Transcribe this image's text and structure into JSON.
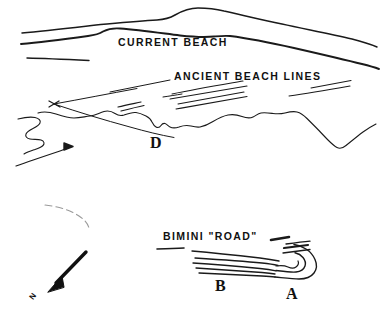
{
  "figure": {
    "name": "bimini-sketch-map",
    "background_color": "#ffffff",
    "ink_color": "#1a1a1a",
    "width": 385,
    "height": 320
  },
  "labels": {
    "current_beach": "CURRENT BEACH",
    "ancient_beach_lines": "ANCIENT BEACH LINES",
    "bimini_road": "BIMINI \"ROAD\"",
    "point_d": "D",
    "point_b": "B",
    "point_a": "A",
    "north": "N"
  },
  "features": [
    {
      "id": "current-beach-shoreline",
      "label": "CURRENT BEACH",
      "type": "shoreline"
    },
    {
      "id": "ancient-beach-lines",
      "label": "ANCIENT BEACH LINES",
      "type": "linear-ridges"
    },
    {
      "id": "submerged-coastline",
      "label": "D",
      "type": "irregular-coastline"
    },
    {
      "id": "bimini-road-structure",
      "label": "BIMINI \"ROAD\"",
      "type": "stone-blocks"
    },
    {
      "id": "site-a",
      "label": "A",
      "type": "site-marker"
    },
    {
      "id": "site-b",
      "label": "B",
      "type": "site-marker"
    },
    {
      "id": "site-d",
      "label": "D",
      "type": "site-marker"
    },
    {
      "id": "north-arrow",
      "label": "N",
      "type": "compass"
    }
  ]
}
